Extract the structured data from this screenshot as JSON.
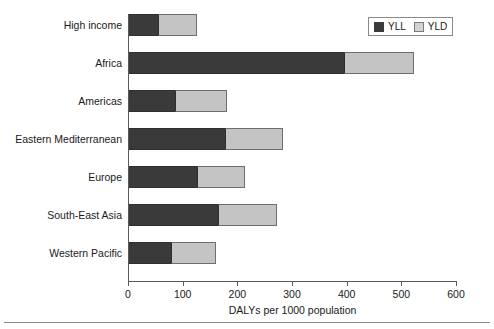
{
  "chart_data": {
    "type": "bar",
    "orientation": "horizontal",
    "stacked": true,
    "title": "",
    "xlabel": "DALYs per 1000 population",
    "ylabel": "",
    "xlim": [
      0,
      600
    ],
    "xticks": [
      0,
      100,
      200,
      300,
      400,
      500,
      600
    ],
    "grid": false,
    "legend_position": "top-right",
    "categories": [
      "High income",
      "Africa",
      "Americas",
      "Eastern Mediterranean",
      "Europe",
      "South-East Asia",
      "Western Pacific"
    ],
    "series": [
      {
        "name": "YLL",
        "color": "#3a3a3a",
        "values": [
          55,
          395,
          86,
          177,
          126,
          165,
          79
        ]
      },
      {
        "name": "YLD",
        "color": "#c4c4c4",
        "values": [
          71,
          128,
          95,
          106,
          88,
          107,
          82
        ]
      }
    ],
    "totals": [
      126,
      523,
      181,
      283,
      214,
      272,
      161
    ]
  },
  "legend": {
    "items": [
      {
        "label": "YLL",
        "swatch": "dark-square-icon"
      },
      {
        "label": "YLD",
        "swatch": "light-square-icon"
      }
    ]
  },
  "axis": {
    "x_title": "DALYs per 1000 population",
    "tick_labels": [
      "0",
      "100",
      "200",
      "300",
      "400",
      "500",
      "600"
    ]
  }
}
